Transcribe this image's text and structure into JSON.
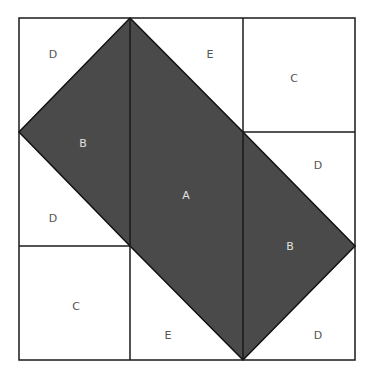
{
  "diagram": {
    "colors": {
      "background": "#ffffff",
      "fill_dark": "#4a4a4a",
      "stroke": "#1a1a1a",
      "label_light": "#e0e0e0",
      "label_dark": "#555555"
    },
    "outer_square": {
      "x": 19,
      "y": 18,
      "width": 336,
      "height": 342
    },
    "shaded_polygon": "130,18 243,132 355,246 243,360 130,246 19,132",
    "lines": [
      {
        "x1": 130,
        "y1": 18,
        "x2": 130,
        "y2": 360
      },
      {
        "x1": 243,
        "y1": 18,
        "x2": 243,
        "y2": 360
      },
      {
        "x1": 243,
        "y1": 132,
        "x2": 355,
        "y2": 132
      },
      {
        "x1": 19,
        "y1": 246,
        "x2": 130,
        "y2": 246
      }
    ],
    "labels": [
      {
        "id": "label-d-top-left",
        "text": "D",
        "x": 53,
        "y": 55,
        "tone": "dark"
      },
      {
        "id": "label-e-top",
        "text": "E",
        "x": 210,
        "y": 55,
        "tone": "dark"
      },
      {
        "id": "label-c-top-right",
        "text": "C",
        "x": 294,
        "y": 79,
        "tone": "dark"
      },
      {
        "id": "label-b-left",
        "text": "B",
        "x": 83,
        "y": 144,
        "tone": "light"
      },
      {
        "id": "label-d-right-upper",
        "text": "D",
        "x": 318,
        "y": 166,
        "tone": "dark"
      },
      {
        "id": "label-a-center",
        "text": "A",
        "x": 186,
        "y": 196,
        "tone": "light"
      },
      {
        "id": "label-d-left-lower",
        "text": "D",
        "x": 53,
        "y": 219,
        "tone": "dark"
      },
      {
        "id": "label-b-right",
        "text": "B",
        "x": 290,
        "y": 247,
        "tone": "light"
      },
      {
        "id": "label-c-bottom-left",
        "text": "C",
        "x": 76,
        "y": 307,
        "tone": "dark"
      },
      {
        "id": "label-e-bottom",
        "text": "E",
        "x": 168,
        "y": 336,
        "tone": "dark"
      },
      {
        "id": "label-d-bottom-right",
        "text": "D",
        "x": 318,
        "y": 336,
        "tone": "dark"
      }
    ]
  }
}
